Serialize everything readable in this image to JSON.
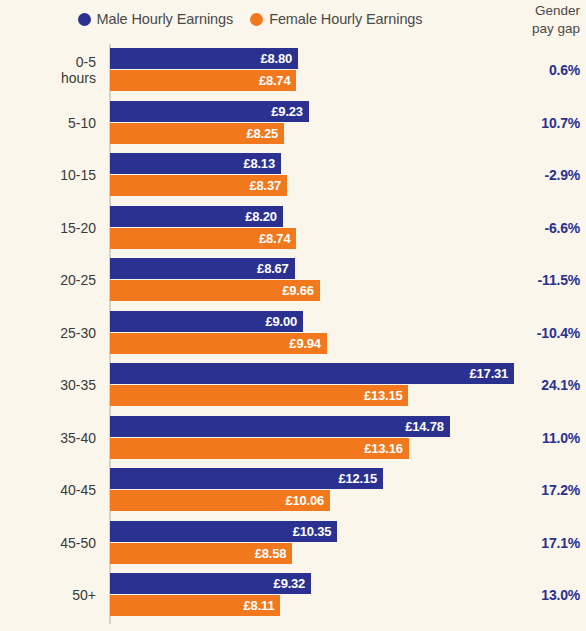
{
  "legend": {
    "items": [
      {
        "label": "Male Hourly Earnings",
        "color": "#2a3190",
        "icon": "circle-dot-icon"
      },
      {
        "label": "Female Hourly Earnings",
        "color": "#f1781c",
        "icon": "circle-dot-icon"
      }
    ]
  },
  "gap_column": {
    "header_line1": "Gender",
    "header_line2": "pay gap"
  },
  "colors": {
    "background": "#faf6ec",
    "male": "#2a3190",
    "female": "#f1781c",
    "gap_text": "#2a3190",
    "label_text": "#3a3a38",
    "axis": "#d8d2c2"
  },
  "chart_data": {
    "type": "bar",
    "orientation": "horizontal",
    "title": "",
    "xlabel": "",
    "ylabel": "",
    "grid": false,
    "legend_position": "top-center",
    "value_prefix": "£",
    "axis_origin": 1.4,
    "px_per_unit": 25.4,
    "categories": [
      "0-5\nhours",
      "5-10",
      "10-15",
      "15-20",
      "20-25",
      "25-30",
      "30-35",
      "35-40",
      "40-45",
      "45-50",
      "50+"
    ],
    "series": [
      {
        "name": "Male Hourly Earnings",
        "color": "#2a3190",
        "values": [
          8.8,
          9.23,
          8.13,
          8.2,
          8.67,
          9.0,
          17.31,
          14.78,
          12.15,
          10.35,
          9.32
        ],
        "labels": [
          "£8.80",
          "£9.23",
          "£8.13",
          "£8.20",
          "£8.67",
          "£9.00",
          "£17.31",
          "£14.78",
          "£12.15",
          "£10.35",
          "£9.32"
        ]
      },
      {
        "name": "Female Hourly Earnings",
        "color": "#f1781c",
        "values": [
          8.74,
          8.25,
          8.37,
          8.74,
          9.66,
          9.94,
          13.15,
          13.16,
          10.06,
          8.58,
          8.11
        ],
        "labels": [
          "£8.74",
          "£8.25",
          "£8.37",
          "£8.74",
          "£9.66",
          "£9.94",
          "£13.15",
          "£13.16",
          "£10.06",
          "£8.58",
          "£8.11"
        ]
      }
    ],
    "annotations": {
      "name": "Gender pay gap",
      "values": [
        "0.6%",
        "10.7%",
        "-2.9%",
        "-6.6%",
        "-11.5%",
        "-10.4%",
        "24.1%",
        "11.0%",
        "17.2%",
        "17.1%",
        "13.0%"
      ]
    }
  }
}
